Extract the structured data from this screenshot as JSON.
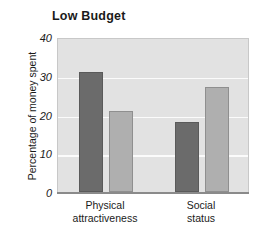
{
  "chart_data": {
    "type": "bar",
    "title": "Low Budget",
    "xlabel": "",
    "ylabel": "Percentage of money spent",
    "categories": [
      "Physical attractiveness",
      "Social status"
    ],
    "category_lines": [
      [
        "Physical",
        "attractiveness"
      ],
      [
        "Social",
        "status"
      ]
    ],
    "series": [
      {
        "name": "dark",
        "color": "#6b6b6b",
        "values": [
          31,
          18
        ]
      },
      {
        "name": "light",
        "color": "#afafaf",
        "values": [
          21,
          27
        ]
      }
    ],
    "ylim": [
      0,
      40
    ],
    "yticks": [
      0,
      10,
      20,
      30,
      40
    ],
    "ytick_labels": [
      "0",
      "10",
      "20",
      "30",
      "40"
    ],
    "grid": true,
    "legend": "none",
    "plot_background": "#e2e2e2",
    "gridline_color": "#fbfbfb"
  }
}
